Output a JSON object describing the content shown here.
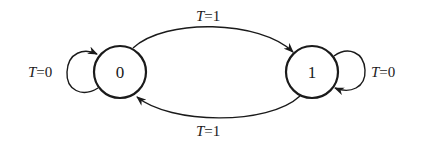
{
  "diagram": {
    "type": "state-transition",
    "states": [
      {
        "id": "s0",
        "label": "0"
      },
      {
        "id": "s1",
        "label": "1"
      }
    ],
    "transitions": [
      {
        "from": "0",
        "to": "1",
        "var": "T",
        "eq": "=",
        "value": "1",
        "position": "top"
      },
      {
        "from": "1",
        "to": "0",
        "var": "T",
        "eq": "=",
        "value": "1",
        "position": "bottom"
      },
      {
        "from": "0",
        "to": "0",
        "var": "T",
        "eq": "=",
        "value": "0",
        "position": "left-self-loop"
      },
      {
        "from": "1",
        "to": "1",
        "var": "T",
        "eq": "=",
        "value": "0",
        "position": "right-self-loop"
      }
    ],
    "colors": {
      "stroke": "#1a1a1a",
      "background": "#ffffff"
    }
  }
}
